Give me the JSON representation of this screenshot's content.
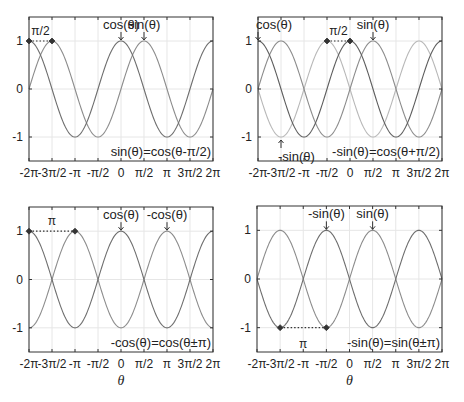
{
  "chart_data": [
    {
      "type": "line",
      "panel": "top-left",
      "title": "",
      "xlabel": "",
      "ylabel": "",
      "xlim": [
        -6.2832,
        6.2832
      ],
      "ylim": [
        -1.5,
        1.5
      ],
      "grid": true,
      "xticks": [
        "-2π",
        "-3π/2",
        "-π",
        "-π/2",
        "0",
        "π/2",
        "π",
        "3π/2",
        "2π"
      ],
      "yticks": [
        "-1",
        "0",
        "1"
      ],
      "series": [
        {
          "name": "cos(θ)",
          "function": "cos",
          "color": "#6e6e6e"
        },
        {
          "name": "sin(θ)",
          "function": "sin",
          "color": "#8c8c8c"
        }
      ],
      "annotations": [
        {
          "text": "cos(θ)",
          "arrow_to": [
            0,
            1
          ]
        },
        {
          "text": "sin(θ)",
          "arrow_to": [
            1.5708,
            1
          ]
        },
        {
          "text": "π/2",
          "dotted_between": [
            [
              -6.2832,
              1
            ],
            [
              -4.7124,
              1
            ]
          ]
        },
        {
          "text": "sin(θ)=cos(θ-π/2)",
          "position": "bottom-right"
        }
      ]
    },
    {
      "type": "line",
      "panel": "top-right",
      "title": "",
      "xlabel": "",
      "ylabel": "",
      "xlim": [
        -6.2832,
        6.2832
      ],
      "ylim": [
        -1.5,
        1.5
      ],
      "grid": true,
      "xticks": [
        "-2π",
        "-3π/2",
        "-π",
        "-π/2",
        "0",
        "π/2",
        "π",
        "3π/2",
        "2π"
      ],
      "yticks": [
        "-1",
        "0",
        "1"
      ],
      "series": [
        {
          "name": "cos(θ)",
          "function": "cos",
          "color": "#5e5e5e"
        },
        {
          "name": "sin(θ)",
          "function": "sin",
          "color": "#8c8c8c"
        },
        {
          "name": "-sin(θ)",
          "function": "-sin",
          "color": "#b8b8b8"
        }
      ],
      "annotations": [
        {
          "text": "cos(θ)",
          "arrow_to": [
            -6.2832,
            1
          ]
        },
        {
          "text": "sin(θ)",
          "arrow_to": [
            1.5708,
            1
          ]
        },
        {
          "text": "-sin(θ)",
          "arrow_to": [
            -4.7124,
            -1
          ]
        },
        {
          "text": "π/2",
          "dotted_between": [
            [
              -1.5708,
              1
            ],
            [
              0,
              1
            ]
          ]
        },
        {
          "text": "-sin(θ)=cos(θ+π/2)",
          "position": "bottom-right"
        }
      ]
    },
    {
      "type": "line",
      "panel": "bottom-left",
      "title": "",
      "xlabel": "θ",
      "ylabel": "",
      "xlim": [
        -6.2832,
        6.2832
      ],
      "ylim": [
        -1.5,
        1.5
      ],
      "grid": true,
      "xticks": [
        "-2π",
        "-3π/2",
        "-π",
        "-π/2",
        "0",
        "π/2",
        "π",
        "3π/2",
        "2π"
      ],
      "yticks": [
        "-1",
        "0",
        "1"
      ],
      "series": [
        {
          "name": "cos(θ)",
          "function": "cos",
          "color": "#6e6e6e"
        },
        {
          "name": "-cos(θ)",
          "function": "-cos",
          "color": "#8c8c8c"
        }
      ],
      "annotations": [
        {
          "text": "cos(θ)",
          "arrow_to": [
            0,
            1
          ]
        },
        {
          "text": "-cos(θ)",
          "arrow_to": [
            3.1416,
            1
          ]
        },
        {
          "text": "π",
          "dotted_between": [
            [
              -6.2832,
              1
            ],
            [
              -3.1416,
              1
            ]
          ]
        },
        {
          "text": "-cos(θ)=cos(θ±π)",
          "position": "bottom-right"
        }
      ]
    },
    {
      "type": "line",
      "panel": "bottom-right",
      "title": "",
      "xlabel": "θ",
      "ylabel": "",
      "xlim": [
        -6.2832,
        6.2832
      ],
      "ylim": [
        -1.5,
        1.5
      ],
      "grid": true,
      "xticks": [
        "-2π",
        "-3π/2",
        "-π",
        "-π/2",
        "0",
        "π/2",
        "π",
        "3π/2",
        "2π"
      ],
      "yticks": [
        "-1",
        "0",
        "1"
      ],
      "series": [
        {
          "name": "sin(θ)",
          "function": "sin",
          "color": "#8c8c8c"
        },
        {
          "name": "-sin(θ)",
          "function": "-sin",
          "color": "#6e6e6e"
        }
      ],
      "annotations": [
        {
          "text": "-sin(θ)",
          "arrow_to": [
            -1.5708,
            1
          ]
        },
        {
          "text": "sin(θ)",
          "arrow_to": [
            1.5708,
            1
          ]
        },
        {
          "text": "π",
          "dotted_between": [
            [
              -4.7124,
              -1
            ],
            [
              -1.5708,
              -1
            ]
          ]
        },
        {
          "text": "-sin(θ)=sin(θ±π)",
          "position": "bottom-right"
        }
      ]
    }
  ],
  "panels": [
    {
      "box": {
        "x": 29,
        "y": 17,
        "w": 184,
        "h": 144
      },
      "show_xlabel": false,
      "labels": {
        "a1": "cos(θ)",
        "a2": "sin(θ)",
        "shift": "π/2",
        "identity": "sin(θ)=cos(θ-π/2)"
      }
    },
    {
      "box": {
        "x": 258,
        "y": 17,
        "w": 184,
        "h": 144
      },
      "show_xlabel": false,
      "labels": {
        "a1": "cos(θ)",
        "a2": "sin(θ)",
        "a3": "-sin(θ)",
        "shift": "π/2",
        "identity": "-sin(θ)=cos(θ+π/2)"
      }
    },
    {
      "box": {
        "x": 29,
        "y": 207,
        "w": 184,
        "h": 145
      },
      "show_xlabel": true,
      "labels": {
        "a1": "cos(θ)",
        "a2": "-cos(θ)",
        "shift": "π",
        "identity": "-cos(θ)=cos(θ±π)"
      }
    },
    {
      "box": {
        "x": 257,
        "y": 206,
        "w": 185,
        "h": 146
      },
      "show_xlabel": true,
      "labels": {
        "a1": "-sin(θ)",
        "a2": "sin(θ)",
        "shift": "π",
        "identity": "-sin(θ)=sin(θ±π)"
      }
    }
  ],
  "axis": {
    "xtick_labels": [
      "-2π",
      "-3π/2",
      "-π",
      "-π/2",
      "0",
      "π/2",
      "π",
      "3π/2",
      "2π"
    ],
    "ytick_labels": [
      "1",
      "0",
      "-1"
    ],
    "xlabel": "θ"
  },
  "colors": {
    "axis": "#333333",
    "grid": "#e6e6e6",
    "curve_dark": "#6a6a6a",
    "curve_mid": "#8c8c8c",
    "curve_light": "#bdbdbd",
    "marker": "#333333"
  }
}
